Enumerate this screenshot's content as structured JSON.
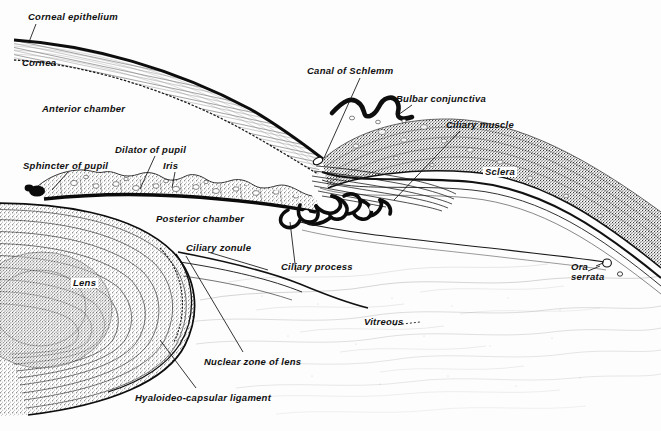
{
  "figure": {
    "kind": "anatomical-diagram",
    "style": "engraved line-and-stipple medical illustration, black ink on white",
    "width": 661,
    "height": 431,
    "ink_color": "#141414",
    "paper_color": "#fdfdfd"
  },
  "labels": [
    {
      "id": "corneal-epithelium",
      "text": "Corneal epithelium",
      "x": 28,
      "y": 12,
      "boxed": false,
      "lines": 1
    },
    {
      "id": "cornea",
      "text": "Cornea",
      "x": 22,
      "y": 58,
      "boxed": false,
      "lines": 1
    },
    {
      "id": "anterior-chamber",
      "text": "Anterior chamber",
      "x": 42,
      "y": 104,
      "boxed": false,
      "lines": 1
    },
    {
      "id": "canal-of-schlemm",
      "text": "Canal of Schlemm",
      "x": 307,
      "y": 66,
      "boxed": false,
      "lines": 1
    },
    {
      "id": "bulbar-conjunctiva",
      "text": "Bulbar conjunctiva",
      "x": 396,
      "y": 94,
      "boxed": false,
      "lines": 1
    },
    {
      "id": "ciliary-muscle",
      "text": "Ciliary muscle",
      "x": 446,
      "y": 120,
      "boxed": false,
      "lines": 1
    },
    {
      "id": "dilator-of-pupil",
      "text": "Dilator of pupil",
      "x": 115,
      "y": 145,
      "boxed": false,
      "lines": 1
    },
    {
      "id": "sphincter-of-pupil",
      "text": "Sphincter of pupil",
      "x": 23,
      "y": 161,
      "boxed": false,
      "lines": 1
    },
    {
      "id": "iris",
      "text": "Iris",
      "x": 163,
      "y": 161,
      "boxed": false,
      "lines": 1
    },
    {
      "id": "sclera",
      "text": "Sclera",
      "x": 483,
      "y": 167,
      "boxed": true,
      "lines": 1
    },
    {
      "id": "posterior-chamber",
      "text": "Posterior  chamber",
      "x": 156,
      "y": 214,
      "boxed": false,
      "lines": 1
    },
    {
      "id": "ciliary-zonule",
      "text": "Ciliary zonule",
      "x": 186,
      "y": 243,
      "boxed": false,
      "lines": 1
    },
    {
      "id": "ciliary-process",
      "text": "Ciliary process",
      "x": 281,
      "y": 262,
      "boxed": false,
      "lines": 1
    },
    {
      "id": "ora-serrata",
      "text": "Ora\nserrata",
      "x": 571,
      "y": 262,
      "boxed": false,
      "lines": 2
    },
    {
      "id": "lens",
      "text": "Lens",
      "x": 71,
      "y": 278,
      "boxed": true,
      "lines": 1
    },
    {
      "id": "vitreous",
      "text": "Vitreous",
      "x": 364,
      "y": 317,
      "boxed": false,
      "lines": 1
    },
    {
      "id": "nuclear-zone-of-lens",
      "text": "Nuclear zone of lens",
      "x": 204,
      "y": 357,
      "boxed": false,
      "lines": 1
    },
    {
      "id": "hyaloideo-capsular-ligament",
      "text": "Hyaloideo-capsular ligament",
      "x": 135,
      "y": 393,
      "boxed": false,
      "lines": 1
    }
  ],
  "structures": [
    {
      "id": "cornea-body",
      "name": "Cornea"
    },
    {
      "id": "corneal-epithelium-line",
      "name": "Corneal epithelium"
    },
    {
      "id": "anterior-chamber-space",
      "name": "Anterior chamber"
    },
    {
      "id": "iris-body",
      "name": "Iris"
    },
    {
      "id": "pupil-sphincter",
      "name": "Sphincter of pupil"
    },
    {
      "id": "pupil-dilator",
      "name": "Dilator of pupil"
    },
    {
      "id": "posterior-chamber-space",
      "name": "Posterior chamber"
    },
    {
      "id": "lens-body",
      "name": "Lens"
    },
    {
      "id": "lens-nucleus",
      "name": "Nuclear zone of lens"
    },
    {
      "id": "ciliary-zonule-fibers",
      "name": "Ciliary zonule"
    },
    {
      "id": "ciliary-processes",
      "name": "Ciliary process"
    },
    {
      "id": "ciliary-muscle-fibers",
      "name": "Ciliary muscle"
    },
    {
      "id": "canal-of-schlemm-lumen",
      "name": "Canal of Schlemm"
    },
    {
      "id": "sclera-body",
      "name": "Sclera"
    },
    {
      "id": "bulbar-conjunctiva-fold",
      "name": "Bulbar conjunctiva"
    },
    {
      "id": "vitreous-body",
      "name": "Vitreous"
    },
    {
      "id": "ora-serrata-point",
      "name": "Ora serrata"
    },
    {
      "id": "hyaloideo-capsular-ligament-line",
      "name": "Hyaloideo-capsular ligament"
    }
  ]
}
